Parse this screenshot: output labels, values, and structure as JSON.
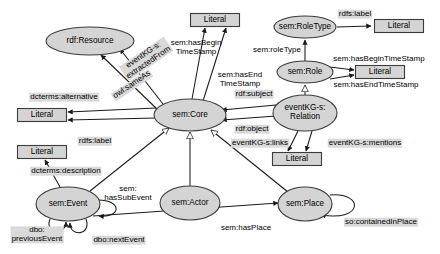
{
  "diagram": {
    "colors": {
      "node_fill": "#d4d4d4",
      "node_stroke": "#3b3b3b",
      "label_bg": "#d9d9d9",
      "edge": "#1a1a1a",
      "background": "#ffffff"
    },
    "class_nodes": [
      {
        "id": "rdf-resource",
        "label": "rdf:Resource",
        "x": 90,
        "y": 41,
        "rx": 44,
        "ry": 14
      },
      {
        "id": "sem-core",
        "label": "sem:Core",
        "x": 190,
        "y": 115,
        "rx": 36,
        "ry": 16
      },
      {
        "id": "sem-roletype",
        "label": "sem:RoleType",
        "x": 305,
        "y": 27,
        "rx": 31,
        "ry": 11
      },
      {
        "id": "sem-role",
        "label": "sem:Role",
        "x": 305,
        "y": 72,
        "rx": 28,
        "ry": 11
      },
      {
        "id": "eventkg-relation",
        "label": "eventKG-s:\nRelation",
        "x": 305,
        "y": 113,
        "rx": 32,
        "ry": 18
      },
      {
        "id": "sem-event",
        "label": "sem:Event",
        "x": 68,
        "y": 204,
        "rx": 32,
        "ry": 17
      },
      {
        "id": "sem-actor",
        "label": "sem:Actor",
        "x": 190,
        "y": 203,
        "rx": 30,
        "ry": 17
      },
      {
        "id": "sem-place",
        "label": "sem:Place",
        "x": 305,
        "y": 204,
        "rx": 27,
        "ry": 17
      }
    ],
    "literal_nodes": [
      {
        "id": "literal-top-center",
        "label": "Literal",
        "x": 215,
        "y": 20,
        "w": 49,
        "h": 13
      },
      {
        "id": "literal-top-right",
        "label": "Literal",
        "x": 399,
        "y": 26,
        "w": 49,
        "h": 13
      },
      {
        "id": "literal-role-right",
        "label": "Literal",
        "x": 380,
        "y": 72,
        "w": 49,
        "h": 13
      },
      {
        "id": "literal-left-upper",
        "label": "Literal",
        "x": 42,
        "y": 115,
        "w": 49,
        "h": 13
      },
      {
        "id": "literal-left-lower",
        "label": "Literal",
        "x": 42,
        "y": 152,
        "w": 49,
        "h": 13
      },
      {
        "id": "literal-relation",
        "label": "Literal",
        "x": 297,
        "y": 159,
        "w": 49,
        "h": 13
      }
    ],
    "edge_labels": [
      {
        "id": "eventkg-extractedfrom",
        "text": "eventKG-s:\nextractedFrom",
        "x": 146,
        "y": 59,
        "rotate": -34,
        "boxed": true
      },
      {
        "id": "owl-sameas",
        "text": "owl:sameAs",
        "x": 132,
        "y": 85,
        "rotate": -34,
        "boxed": true
      },
      {
        "id": "sem-hasbegintimestamp-core",
        "text": "sem:hasBegin\nTimeStamp",
        "x": 196,
        "y": 48,
        "rotate": 0,
        "boxed": false
      },
      {
        "id": "sem-hasendtimestamp-core",
        "text": "sem:hasEnd\nTimeStamp",
        "x": 240,
        "y": 80,
        "rotate": 0,
        "boxed": false
      },
      {
        "id": "dcterms-alternative",
        "text": "dcterms:alternative",
        "x": 64,
        "y": 97,
        "rotate": 0,
        "boxed": true
      },
      {
        "id": "rdfs-label-core",
        "text": "rdfs:label",
        "x": 95,
        "y": 141,
        "rotate": 0,
        "boxed": true
      },
      {
        "id": "dcterms-description",
        "text": "dcterms:description",
        "x": 66,
        "y": 171,
        "rotate": 0,
        "boxed": true
      },
      {
        "id": "sem-hassubevent",
        "text": "sem:\nhasSubEvent",
        "x": 128,
        "y": 194,
        "rotate": 0,
        "boxed": false
      },
      {
        "id": "dbo-previousevent",
        "text": "dbo:\npreviousEvent",
        "x": 37,
        "y": 235,
        "rotate": 0,
        "boxed": true
      },
      {
        "id": "dbo-nextevent",
        "text": "dbo:nextEvent",
        "x": 119,
        "y": 240,
        "rotate": 0,
        "boxed": true
      },
      {
        "id": "sem-hasplace",
        "text": "sem:hasPlace",
        "x": 246,
        "y": 228,
        "rotate": 0,
        "boxed": false
      },
      {
        "id": "rdfs-label-roletype",
        "text": "rdfs:label",
        "x": 355,
        "y": 14,
        "rotate": 0,
        "boxed": true
      },
      {
        "id": "sem-roletype-edge",
        "text": "sem:roleType",
        "x": 277,
        "y": 50,
        "rotate": 0,
        "boxed": false
      },
      {
        "id": "sem-hasbegintimestamp-role",
        "text": "sem:hasBeginTimeStamp",
        "x": 379,
        "y": 59,
        "rotate": 0,
        "boxed": false
      },
      {
        "id": "sem-hasendtimestamp-role",
        "text": "sem:hasEndTimeStamp",
        "x": 376,
        "y": 85,
        "rotate": 0,
        "boxed": false
      },
      {
        "id": "rdf-subject",
        "text": "rdf:subject",
        "x": 254,
        "y": 94,
        "rotate": 0,
        "boxed": true
      },
      {
        "id": "rdf-object",
        "text": "rdf:object",
        "x": 252,
        "y": 129,
        "rotate": 0,
        "boxed": true
      },
      {
        "id": "eventkg-links",
        "text": "eventKG-s:links",
        "x": 260,
        "y": 143,
        "rotate": 0,
        "boxed": true
      },
      {
        "id": "eventkg-mentions",
        "text": "eventKG-s:mentions",
        "x": 365,
        "y": 143,
        "rotate": 0,
        "boxed": true
      },
      {
        "id": "so-containedinplace",
        "text": "so:containedInPlace",
        "x": 381,
        "y": 222,
        "rotate": 0,
        "boxed": true
      }
    ]
  }
}
